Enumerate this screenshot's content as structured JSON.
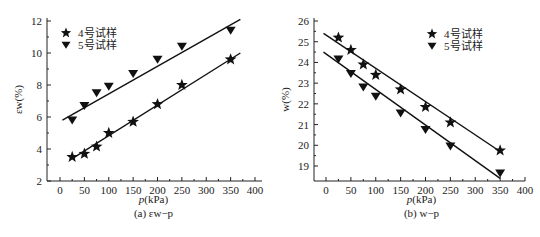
{
  "chart_data": [
    {
      "type": "scatter",
      "title": "",
      "caption": "(a) εw−p",
      "xlabel": "p(kPa)",
      "ylabel": "εw(%)",
      "xlim": [
        -20,
        400
      ],
      "ylim": [
        2,
        12
      ],
      "xticks": [
        0,
        50,
        100,
        150,
        200,
        250,
        300,
        350,
        400
      ],
      "yticks": [
        2,
        4,
        6,
        8,
        10,
        12
      ],
      "legend_position": "upper-left",
      "series": [
        {
          "name": "4号试样",
          "marker": "star",
          "x": [
            25,
            50,
            75,
            100,
            150,
            200,
            250,
            350
          ],
          "y": [
            3.5,
            3.7,
            4.15,
            5.0,
            5.7,
            6.8,
            8.0,
            9.6
          ],
          "fit": {
            "x": [
              25,
              370
            ],
            "y": [
              3.4,
              10.0
            ]
          }
        },
        {
          "name": "5号试样",
          "marker": "triangle-down",
          "x": [
            25,
            50,
            75,
            100,
            150,
            200,
            250,
            350
          ],
          "y": [
            5.8,
            6.7,
            7.5,
            7.9,
            8.7,
            9.6,
            10.4,
            11.4
          ],
          "fit": {
            "x": [
              5,
              370
            ],
            "y": [
              5.8,
              12.1
            ]
          }
        }
      ],
      "grid": false
    },
    {
      "type": "scatter",
      "title": "",
      "caption": "(b) w−p",
      "xlabel": "p(kPa)",
      "ylabel": "w(%)",
      "xlim": [
        -20,
        400
      ],
      "ylim": [
        18.3,
        26
      ],
      "xticks": [
        0,
        50,
        100,
        150,
        200,
        250,
        300,
        350,
        400
      ],
      "yticks": [
        19,
        20,
        21,
        22,
        23,
        24,
        25,
        26
      ],
      "legend_position": "upper-right",
      "series": [
        {
          "name": "4号试样",
          "marker": "star",
          "x": [
            25,
            50,
            75,
            100,
            150,
            200,
            250,
            350
          ],
          "y": [
            25.2,
            24.6,
            23.9,
            23.4,
            22.7,
            21.85,
            21.1,
            19.75
          ],
          "fit": {
            "x": [
              -5,
              350
            ],
            "y": [
              25.4,
              19.7
            ]
          }
        },
        {
          "name": "5号试样",
          "marker": "triangle-down",
          "x": [
            25,
            50,
            75,
            100,
            150,
            200,
            250,
            350
          ],
          "y": [
            24.15,
            23.45,
            22.8,
            22.35,
            21.55,
            20.75,
            19.95,
            18.65
          ],
          "fit": {
            "x": [
              -5,
              350
            ],
            "y": [
              24.5,
              18.4
            ]
          }
        }
      ],
      "grid": false
    }
  ]
}
